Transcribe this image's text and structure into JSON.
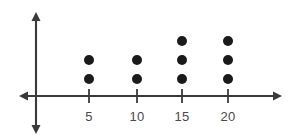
{
  "chart_data": {
    "type": "scatter",
    "plot_kind": "dot-plot",
    "title": "",
    "subtitle": "",
    "xlabel": "",
    "ylabel": "",
    "categories": [
      "5",
      "10",
      "15",
      "20"
    ],
    "x": [
      5,
      10,
      15,
      20
    ],
    "values": [
      2,
      2,
      3,
      3
    ],
    "counts": [
      {
        "category": "5",
        "dots": 2
      },
      {
        "category": "10",
        "dots": 2
      },
      {
        "category": "15",
        "dots": 3
      },
      {
        "category": "20",
        "dots": 3
      }
    ],
    "tick_labels": [
      "5",
      "10",
      "15",
      "20"
    ],
    "legend": [],
    "annotations": [],
    "grid": false,
    "legend_position": "none",
    "axes": {
      "x_axis_visible": true,
      "y_axis_visible": true,
      "x_axis_arrows": "both",
      "y_axis_arrows": "both",
      "x_tick_count": 4
    },
    "colors": {
      "dot": "#1a1a1a",
      "axis": "#3a3a3a",
      "label": "#4a4a4a",
      "background": "#ffffff"
    }
  },
  "geometry": {
    "width": 297,
    "height": 140,
    "axis_y": 96,
    "y_axis_x": 36,
    "x_left_tip": 19,
    "x_right_tip": 282,
    "y_top_tip": 12,
    "y_bottom_tip": 134,
    "tick_x": [
      89,
      137,
      182,
      228
    ],
    "tick_half": 7,
    "dot_radius": 5,
    "dot_base_y": 79,
    "dot_spacing": 19,
    "label_y": 110
  }
}
